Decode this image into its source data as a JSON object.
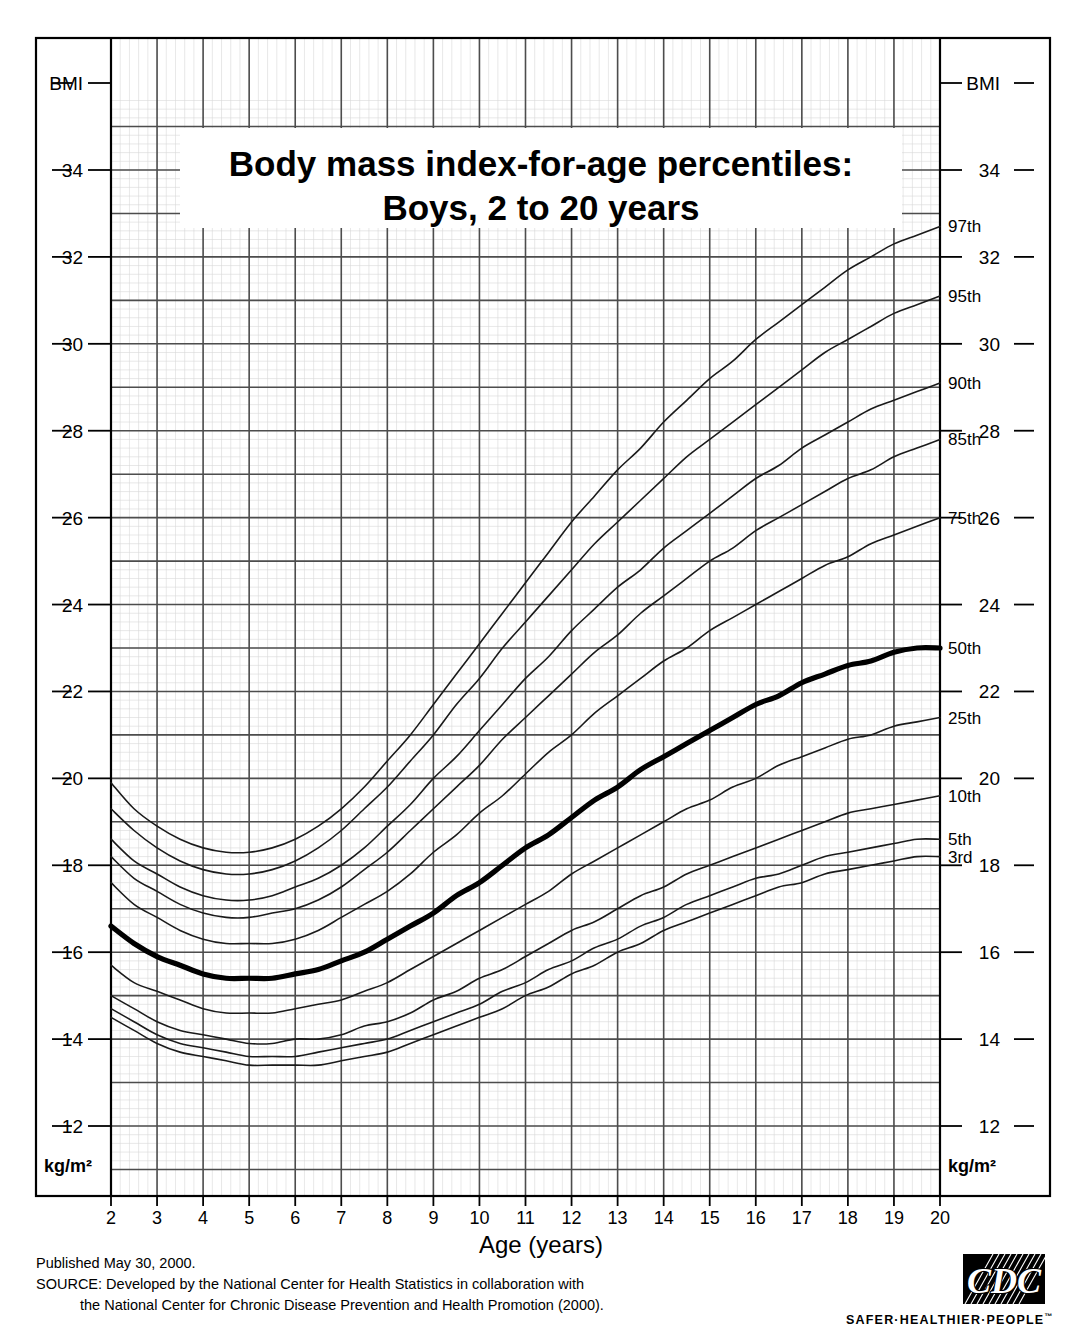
{
  "title": {
    "line1": "Body mass index-for-age percentiles:",
    "line2": "Boys, 2 to 20 years"
  },
  "axes": {
    "x_title": "Age (years)",
    "x_ticks": [
      2,
      3,
      4,
      5,
      6,
      7,
      8,
      9,
      10,
      11,
      12,
      13,
      14,
      15,
      16,
      17,
      18,
      19,
      20
    ],
    "x_min": 2,
    "x_max": 20,
    "y_ticks": [
      12,
      14,
      16,
      18,
      20,
      22,
      24,
      26,
      28,
      30,
      32,
      34
    ],
    "y_min": 11.0,
    "y_max": 35.6,
    "y_label_top_left": "BMI",
    "y_label_top_right": "BMI",
    "y_label_bottom_left": "kg/m2",
    "y_label_bottom_right": "kg/m2",
    "y_unit_display": "kg/m²"
  },
  "footer": {
    "published": "Published May 30, 2000.",
    "source_line1": "SOURCE: Developed by the National Center for Health Statistics in collaboration with",
    "source_line2": "the National Center for Chronic Disease Prevention and Health Promotion (2000)."
  },
  "logo": {
    "name": "CDC",
    "tagline": "SAFER·HEALTHIER·PEOPLE",
    "trademark": "™"
  },
  "colors": {
    "line": "#1a1a1a",
    "grid_major": "#4d4d4d",
    "grid_minor": "#d8d8d8",
    "border": "#000000",
    "background": "#ffffff",
    "median_emphasis": "#000000"
  },
  "chart_data": {
    "type": "line",
    "title": "Body mass index-for-age percentiles: Boys, 2 to 20 years",
    "xlabel": "Age (years)",
    "ylabel": "BMI (kg/m²)",
    "xlim": [
      2,
      20
    ],
    "ylim": [
      11.0,
      35.6
    ],
    "grid": true,
    "legend": "inline-right-end-labels",
    "x": [
      2,
      2.5,
      3,
      3.5,
      4,
      4.5,
      5,
      5.5,
      6,
      6.5,
      7,
      7.5,
      8,
      8.5,
      9,
      9.5,
      10,
      10.5,
      11,
      11.5,
      12,
      12.5,
      13,
      13.5,
      14,
      14.5,
      15,
      15.5,
      16,
      16.5,
      17,
      17.5,
      18,
      18.5,
      19,
      19.5,
      20
    ],
    "series": [
      {
        "name": "97th",
        "label": "97th",
        "values": [
          19.9,
          19.3,
          18.9,
          18.6,
          18.4,
          18.3,
          18.3,
          18.4,
          18.6,
          18.9,
          19.3,
          19.8,
          20.4,
          21.0,
          21.7,
          22.4,
          23.1,
          23.8,
          24.5,
          25.2,
          25.9,
          26.5,
          27.1,
          27.6,
          28.2,
          28.7,
          29.2,
          29.6,
          30.1,
          30.5,
          30.9,
          31.3,
          31.7,
          32.0,
          32.3,
          32.5,
          32.7
        ]
      },
      {
        "name": "95th",
        "label": "95th",
        "values": [
          19.3,
          18.8,
          18.4,
          18.1,
          17.9,
          17.8,
          17.8,
          17.9,
          18.1,
          18.4,
          18.8,
          19.3,
          19.8,
          20.4,
          21.0,
          21.7,
          22.3,
          23.0,
          23.6,
          24.2,
          24.8,
          25.4,
          25.9,
          26.4,
          26.9,
          27.4,
          27.8,
          28.2,
          28.6,
          29.0,
          29.4,
          29.8,
          30.1,
          30.4,
          30.7,
          30.9,
          31.1
        ]
      },
      {
        "name": "90th",
        "label": "90th",
        "values": [
          18.6,
          18.1,
          17.8,
          17.5,
          17.3,
          17.2,
          17.2,
          17.3,
          17.5,
          17.7,
          18.0,
          18.4,
          18.9,
          19.4,
          20.0,
          20.5,
          21.1,
          21.7,
          22.3,
          22.8,
          23.4,
          23.9,
          24.4,
          24.8,
          25.3,
          25.7,
          26.1,
          26.5,
          26.9,
          27.2,
          27.6,
          27.9,
          28.2,
          28.5,
          28.7,
          28.9,
          29.1
        ]
      },
      {
        "name": "85th",
        "label": "85th",
        "values": [
          18.2,
          17.7,
          17.4,
          17.1,
          16.9,
          16.8,
          16.8,
          16.9,
          17.0,
          17.2,
          17.5,
          17.9,
          18.3,
          18.8,
          19.3,
          19.8,
          20.3,
          20.9,
          21.4,
          21.9,
          22.4,
          22.9,
          23.3,
          23.8,
          24.2,
          24.6,
          25.0,
          25.3,
          25.7,
          26.0,
          26.3,
          26.6,
          26.9,
          27.1,
          27.4,
          27.6,
          27.8
        ]
      },
      {
        "name": "75th",
        "label": "75th",
        "values": [
          17.6,
          17.1,
          16.8,
          16.5,
          16.3,
          16.2,
          16.2,
          16.2,
          16.3,
          16.5,
          16.8,
          17.1,
          17.4,
          17.8,
          18.3,
          18.7,
          19.2,
          19.6,
          20.1,
          20.6,
          21.0,
          21.5,
          21.9,
          22.3,
          22.7,
          23.0,
          23.4,
          23.7,
          24.0,
          24.3,
          24.6,
          24.9,
          25.1,
          25.4,
          25.6,
          25.8,
          26.0
        ]
      },
      {
        "name": "50th",
        "label": "50th",
        "values": [
          16.6,
          16.2,
          15.9,
          15.7,
          15.5,
          15.4,
          15.4,
          15.4,
          15.5,
          15.6,
          15.8,
          16.0,
          16.3,
          16.6,
          16.9,
          17.3,
          17.6,
          18.0,
          18.4,
          18.7,
          19.1,
          19.5,
          19.8,
          20.2,
          20.5,
          20.8,
          21.1,
          21.4,
          21.7,
          21.9,
          22.2,
          22.4,
          22.6,
          22.7,
          22.9,
          23.0,
          23.0
        ],
        "emphasis": true
      },
      {
        "name": "25th",
        "label": "25th",
        "values": [
          15.7,
          15.3,
          15.1,
          14.9,
          14.7,
          14.6,
          14.6,
          14.6,
          14.7,
          14.8,
          14.9,
          15.1,
          15.3,
          15.6,
          15.9,
          16.2,
          16.5,
          16.8,
          17.1,
          17.4,
          17.8,
          18.1,
          18.4,
          18.7,
          19.0,
          19.3,
          19.5,
          19.8,
          20.0,
          20.3,
          20.5,
          20.7,
          20.9,
          21.0,
          21.2,
          21.3,
          21.4
        ]
      },
      {
        "name": "10th",
        "label": "10th",
        "values": [
          15.0,
          14.7,
          14.4,
          14.2,
          14.1,
          14.0,
          13.9,
          13.9,
          14.0,
          14.0,
          14.1,
          14.3,
          14.4,
          14.6,
          14.9,
          15.1,
          15.4,
          15.6,
          15.9,
          16.2,
          16.5,
          16.7,
          17.0,
          17.3,
          17.5,
          17.8,
          18.0,
          18.2,
          18.4,
          18.6,
          18.8,
          19.0,
          19.2,
          19.3,
          19.4,
          19.5,
          19.6
        ]
      },
      {
        "name": "5th",
        "label": "5th",
        "values": [
          14.7,
          14.4,
          14.1,
          13.9,
          13.8,
          13.7,
          13.6,
          13.6,
          13.6,
          13.7,
          13.8,
          13.9,
          14.0,
          14.2,
          14.4,
          14.6,
          14.8,
          15.1,
          15.3,
          15.6,
          15.8,
          16.1,
          16.3,
          16.6,
          16.8,
          17.1,
          17.3,
          17.5,
          17.7,
          17.8,
          18.0,
          18.2,
          18.3,
          18.4,
          18.5,
          18.6,
          18.6
        ]
      },
      {
        "name": "3rd",
        "label": "3rd",
        "values": [
          14.5,
          14.2,
          13.9,
          13.7,
          13.6,
          13.5,
          13.4,
          13.4,
          13.4,
          13.4,
          13.5,
          13.6,
          13.7,
          13.9,
          14.1,
          14.3,
          14.5,
          14.7,
          15.0,
          15.2,
          15.5,
          15.7,
          16.0,
          16.2,
          16.5,
          16.7,
          16.9,
          17.1,
          17.3,
          17.5,
          17.6,
          17.8,
          17.9,
          18.0,
          18.1,
          18.2,
          18.2
        ]
      }
    ]
  }
}
